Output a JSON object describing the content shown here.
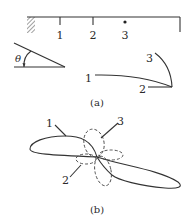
{
  "figure_a": {
    "caption": "(a)",
    "beam": {
      "node_labels": [
        "1",
        "2",
        "3"
      ],
      "support": "fixed-wall-hatched",
      "node_3_marker": "dot"
    },
    "angle": {
      "symbol": "θ"
    },
    "mode_shape": {
      "labels": [
        "1",
        "2",
        "3"
      ]
    }
  },
  "figure_b": {
    "caption": "(b)",
    "labels": [
      "1",
      "2",
      "3"
    ],
    "line_styles": {
      "1": "solid",
      "2": "dashed",
      "3": "dashed"
    }
  },
  "colors": {
    "ink": "#333333",
    "background": "#ffffff"
  }
}
